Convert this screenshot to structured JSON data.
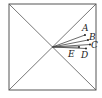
{
  "diagram": {
    "type": "geometry",
    "square": {
      "x1": 9,
      "y1": 4,
      "x2": 96,
      "y2": 90
    },
    "center": {
      "x": 52.5,
      "y": 47
    },
    "points": [
      {
        "label": "A",
        "x": 85,
        "y": 35,
        "lx": 82,
        "ly": 31
      },
      {
        "label": "B",
        "x": 88,
        "y": 40,
        "lx": 89,
        "ly": 40
      },
      {
        "label": "C",
        "x": 90,
        "y": 44.5,
        "lx": 91,
        "ly": 48
      },
      {
        "label": "D",
        "x": 86,
        "y": 48.5,
        "lx": 81,
        "ly": 58
      },
      {
        "label": "E",
        "x": 79,
        "y": 47,
        "lx": 68,
        "ly": 57
      }
    ],
    "stroke_color": "#444444"
  }
}
